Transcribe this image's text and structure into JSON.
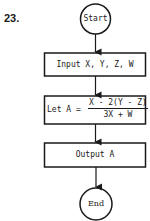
{
  "problem_number": "23.",
  "flowchart": {
    "start": "Start",
    "input": "Input X, Y, Z, W",
    "assign_prefix": "Let A =",
    "assign_numerator": "X - 2(Y - Z)",
    "assign_denominator": "3X + W",
    "output": "Output A",
    "end": "End"
  }
}
